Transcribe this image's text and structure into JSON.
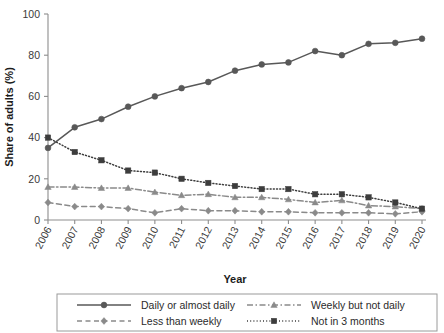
{
  "chart_data": {
    "type": "line",
    "title": "",
    "xlabel": "Year",
    "ylabel": "Share of adults (%)",
    "categories": [
      2006,
      2007,
      2008,
      2009,
      2010,
      2011,
      2012,
      2013,
      2014,
      2015,
      2016,
      2017,
      2018,
      2019,
      2020
    ],
    "x": [
      "2006",
      "2007",
      "2008",
      "2009",
      "2010",
      "2011",
      "2012",
      "2013",
      "2014",
      "2015",
      "2016",
      "2017",
      "2018",
      "2019",
      "2020"
    ],
    "xlim": [
      2006,
      2020
    ],
    "ylim": [
      0,
      100
    ],
    "yticks": [
      0,
      20,
      40,
      60,
      80,
      100
    ],
    "ytick_labels": [
      "0",
      "20",
      "40",
      "60",
      "80",
      "100"
    ],
    "xticks": [
      "2006",
      "2007",
      "2008",
      "2009",
      "2010",
      "2011",
      "2012",
      "2013",
      "2014",
      "2015",
      "2016",
      "2017",
      "2018",
      "2019",
      "2020"
    ],
    "grid": false,
    "legend_position": "bottom",
    "series": [
      {
        "name": "Daily or almost daily",
        "values": [
          35,
          45,
          49,
          55,
          60,
          64,
          67,
          72.5,
          75.5,
          76.5,
          82,
          80,
          85.5,
          86,
          88
        ],
        "color": "#585858",
        "line_style": "solid",
        "marker": "circle"
      },
      {
        "name": "Weekly but not daily",
        "values": [
          16,
          16,
          15.5,
          15.5,
          13.5,
          12,
          12.5,
          11,
          11,
          10,
          8.5,
          9.5,
          7,
          6.5,
          5.5
        ],
        "color": "#8a8a8a",
        "line_style": "dash-dot",
        "marker": "triangle"
      },
      {
        "name": "Less than weekly",
        "values": [
          8.5,
          6.5,
          6.5,
          5.5,
          3.5,
          5.5,
          4.5,
          4.5,
          4,
          4,
          3.5,
          3.5,
          3.5,
          3,
          4
        ],
        "color": "#8a8a8a",
        "line_style": "dashed",
        "marker": "diamond"
      },
      {
        "name": "Not in 3 months",
        "values": [
          40,
          33,
          29,
          24,
          23,
          20,
          18,
          16.5,
          15,
          15,
          12.5,
          12.5,
          11,
          8.5,
          5.5
        ],
        "color": "#3d3d3d",
        "line_style": "dotted",
        "marker": "square"
      }
    ]
  },
  "legend": {
    "entries": [
      {
        "label": "Daily or almost daily"
      },
      {
        "label": "Weekly but not daily"
      },
      {
        "label": "Less than weekly"
      },
      {
        "label": "Not in 3 months"
      }
    ]
  },
  "axes": {
    "y_title": "Share of adults (%)",
    "x_title": "Year"
  },
  "colors": {
    "dark": "#585858",
    "darker": "#3d3d3d",
    "light": "#8a8a8a",
    "axis": "#8d8d8d",
    "text": "#2b2b2b"
  }
}
